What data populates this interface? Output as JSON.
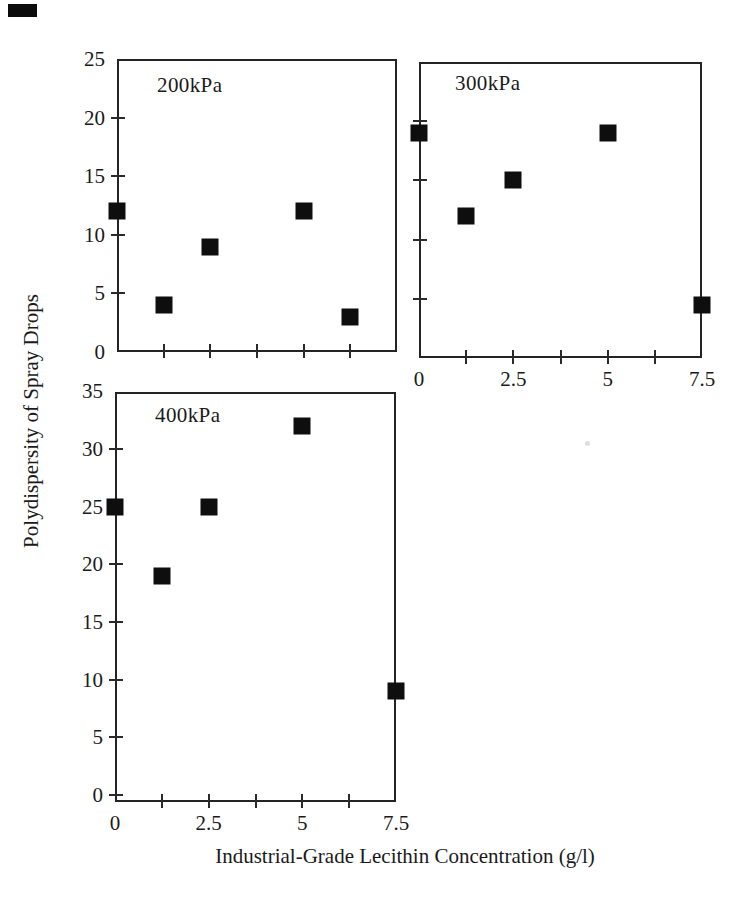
{
  "figure": {
    "y_axis_label": "Polydispersity of Spray Drops",
    "x_axis_label": "Industrial-Grade Lecithin Concentration (g/l)",
    "ink_color": "#1a1a1a",
    "marker_color": "#0e0e0e",
    "background": "#ffffff"
  },
  "chart_data": [
    {
      "type": "scatter",
      "title": "200kPa",
      "marker": "filled-black-square",
      "x": [
        0,
        1.25,
        2.5,
        5,
        6.25
      ],
      "y": [
        12,
        4,
        9,
        12,
        3
      ],
      "xlim": [
        0,
        7.5
      ],
      "ylim": [
        0,
        25
      ],
      "x_ticks": [
        1.25,
        2.5,
        3.75,
        5,
        6.25
      ],
      "x_tick_labels": [],
      "y_ticks": [
        5,
        10,
        15,
        20
      ],
      "y_tick_labels": [
        [
          0,
          "0"
        ],
        [
          5,
          "5"
        ],
        [
          10,
          "10"
        ],
        [
          15,
          "15"
        ],
        [
          20,
          "20"
        ],
        [
          25,
          "25"
        ]
      ],
      "grid": false,
      "legend": "none"
    },
    {
      "type": "scatter",
      "title": "300kPa",
      "marker": "filled-black-square",
      "x": [
        0,
        1.25,
        2.5,
        5,
        7.5
      ],
      "y": [
        19,
        12,
        15,
        19,
        4.5
      ],
      "xlim": [
        0,
        7.5
      ],
      "ylim": [
        0,
        25
      ],
      "x_ticks": [
        1.25,
        2.5,
        3.75,
        5,
        6.25
      ],
      "x_tick_labels": [
        [
          0,
          "0"
        ],
        [
          2.5,
          "2.5"
        ],
        [
          5,
          "5"
        ],
        [
          7.5,
          "7.5"
        ]
      ],
      "y_ticks": [
        5,
        10,
        15,
        20
      ],
      "y_tick_labels": [],
      "grid": false,
      "legend": "none"
    },
    {
      "type": "scatter",
      "title": "400kPa",
      "marker": "filled-black-square",
      "x": [
        0,
        1.25,
        2.5,
        5,
        7.5
      ],
      "y": [
        25,
        19,
        25,
        32,
        9
      ],
      "xlim": [
        0,
        7.5
      ],
      "ylim": [
        0,
        35
      ],
      "x_ticks": [
        1.25,
        2.5,
        3.75,
        5,
        6.25
      ],
      "x_tick_labels": [
        [
          0,
          "0"
        ],
        [
          2.5,
          "2.5"
        ],
        [
          5,
          "5"
        ],
        [
          7.5,
          "7.5"
        ]
      ],
      "y_ticks": [
        0,
        5,
        10,
        15,
        20,
        25,
        30
      ],
      "y_tick_labels": [
        [
          0,
          "0"
        ],
        [
          5,
          "5"
        ],
        [
          10,
          "10"
        ],
        [
          15,
          "15"
        ],
        [
          20,
          "20"
        ],
        [
          25,
          "25"
        ],
        [
          30,
          "30"
        ],
        [
          35,
          "35"
        ]
      ],
      "grid": false,
      "legend": "none"
    }
  ]
}
